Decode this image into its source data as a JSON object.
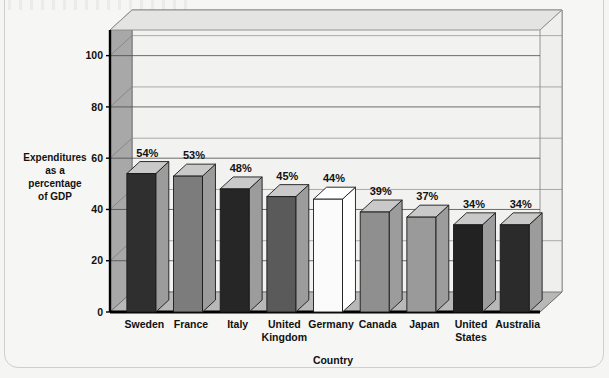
{
  "chart_data": {
    "type": "bar",
    "title": "",
    "xlabel": "Country",
    "ylabel": "Expenditures as a percentage of GDP",
    "ylabel_lines": [
      "Expenditures",
      "as a",
      "percentage",
      "of GDP"
    ],
    "categories": [
      "Sweden",
      "France",
      "Italy",
      "United Kingdom",
      "Germany",
      "Canada",
      "Japan",
      "United States",
      "Australia"
    ],
    "category_lines": [
      [
        "Sweden"
      ],
      [
        "France"
      ],
      [
        "Italy"
      ],
      [
        "United",
        "Kingdom"
      ],
      [
        "Germany"
      ],
      [
        "Canada"
      ],
      [
        "Japan"
      ],
      [
        "United",
        "States"
      ],
      [
        "Australia"
      ]
    ],
    "values": [
      54,
      53,
      48,
      45,
      44,
      39,
      37,
      34,
      34
    ],
    "value_labels": [
      "54%",
      "53%",
      "48%",
      "45%",
      "44%",
      "39%",
      "37%",
      "34%",
      "34%"
    ],
    "bar_fills": [
      "#2f2f2f",
      "#7c7c7c",
      "#262626",
      "#5a5a5a",
      "#fbfbfb",
      "#8f8f8f",
      "#9a9a9a",
      "#222222",
      "#2b2b2b"
    ],
    "ytick_labels": [
      "0",
      "20",
      "40",
      "60",
      "80",
      "100"
    ],
    "yticks": [
      0,
      20,
      40,
      60,
      80,
      100
    ],
    "ylim": [
      0,
      110
    ],
    "grid": true,
    "legend": "none",
    "style": "3d-column"
  },
  "colors": {
    "plot_background": "#f2f2f0",
    "floor": "#b8b8b8",
    "left_wall": "#a8a8a8",
    "top_plane": "#e4e4e2",
    "gridline": "#4a4a4a",
    "axis": "#000000",
    "bar_side": "#9c9c9c",
    "bar_top": "#c9c9c9",
    "page": "#f5f5f3"
  }
}
